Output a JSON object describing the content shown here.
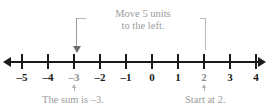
{
  "diagram": {
    "callout": {
      "line1": "Move 5 units",
      "line2": "to the left.",
      "color": "#9b9b9b"
    },
    "captions": {
      "left": "The sum is –3.",
      "right": "Start at 2."
    },
    "number_line": {
      "min": -5,
      "max": 4,
      "tick_labels": [
        "–5",
        "–4",
        "–3",
        "–2",
        "–1",
        "0",
        "1",
        "2",
        "3",
        "4"
      ],
      "axis_color": "#1a1a1a",
      "highlight_values": [
        "–3",
        "2"
      ],
      "start_value": "2",
      "end_value": "–3",
      "move_units": "5",
      "move_direction": "left"
    }
  },
  "chart_data": {
    "type": "line",
    "title": "Move 5 units to the left.",
    "xlabel": "",
    "ylabel": "",
    "xlim": [
      -5,
      4
    ],
    "categories": [
      "–5",
      "–4",
      "–3",
      "–2",
      "–1",
      "0",
      "1",
      "2",
      "3",
      "4"
    ],
    "values": [
      -5,
      -4,
      -3,
      -2,
      -1,
      0,
      1,
      2,
      3,
      4
    ],
    "annotations": [
      {
        "text": "Move 5 units to the left.",
        "from_x": 2,
        "to_x": -3
      },
      {
        "text": "Start at 2.",
        "x": 2
      },
      {
        "text": "The sum is –3.",
        "x": -3
      }
    ],
    "grid": false,
    "legend": "none"
  }
}
